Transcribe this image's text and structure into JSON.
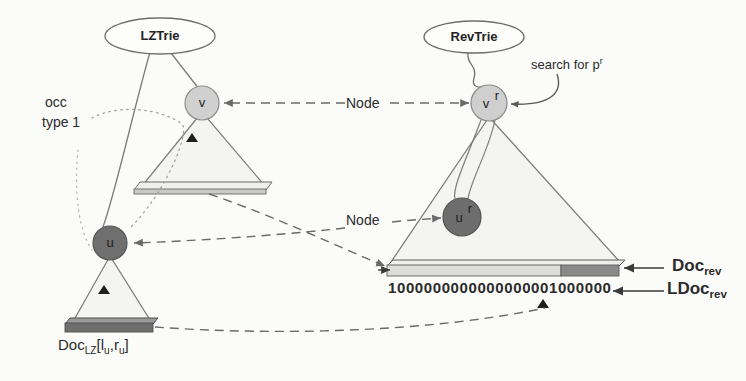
{
  "figure": {
    "background_color": "#fbfbf9"
  },
  "ellipses": [
    {
      "id": "lztrie",
      "label": "LZTrie",
      "cx": 160,
      "cy": 36,
      "rx": 55,
      "ry": 18
    },
    {
      "id": "revtrie",
      "label": "RevTrie",
      "cx": 474,
      "cy": 37,
      "rx": 50,
      "ry": 16
    }
  ],
  "nodes": [
    {
      "id": "v",
      "label": "v",
      "sup": "",
      "cx": 202,
      "cy": 103,
      "r": 17,
      "fill": "#d0d0d0",
      "stroke": "#8d8d8d"
    },
    {
      "id": "u",
      "label": "u",
      "sup": "",
      "cx": 110,
      "cy": 243,
      "r": 17,
      "fill": "#6f6f6f",
      "stroke": "#555555"
    },
    {
      "id": "vr",
      "label": "v",
      "sup": "r",
      "cx": 489,
      "cy": 103,
      "r": 18,
      "fill": "#cfcfcf",
      "stroke": "#8a8a8a"
    },
    {
      "id": "ur",
      "label": "u",
      "sup": "r",
      "cx": 462,
      "cy": 217,
      "r": 19,
      "fill": "#6d6d6d",
      "stroke": "#535353"
    }
  ],
  "triangles": [
    {
      "id": "lztrie-subtree-v",
      "apex_x": 202,
      "apex_y": 112,
      "left_x": 142,
      "right_x": 265,
      "base_y": 190,
      "fill": "#f4f4f2",
      "stroke": "#7d7d7d"
    },
    {
      "id": "lztrie-subtree-u",
      "apex_x": 110,
      "apex_y": 255,
      "left_x": 72,
      "right_x": 152,
      "base_y": 323,
      "fill": "#f4f4f2",
      "stroke": "#7d7d7d"
    },
    {
      "id": "revtrie-subtree-vr",
      "apex_x": 489,
      "apex_y": 115,
      "left_x": 390,
      "right_x": 620,
      "base_y": 263,
      "fill": "#f4f4f2",
      "stroke": "#7d7d7d"
    }
  ],
  "bars": [
    {
      "id": "doc-lz-range-bar-top",
      "x": 142,
      "y": 183,
      "width": 126,
      "height": 11,
      "segments": [
        {
          "fill": "#d8d8d8",
          "width_pct": 100
        }
      ],
      "stroke": "#6a6a6a"
    },
    {
      "id": "doc-lz-bar",
      "x": 69,
      "y": 321,
      "width": 86,
      "height": 12,
      "segments": [
        {
          "fill": "#7a7a7a",
          "width_pct": 100
        }
      ],
      "stroke": "#4f4f4f"
    },
    {
      "id": "doc-rev-bar",
      "x": 390,
      "y": 263,
      "width": 229,
      "height": 13,
      "segments": [
        {
          "fill": "#dcdcda",
          "width_pct": 76
        },
        {
          "fill": "#8a8a8a",
          "width_pct": 24
        }
      ],
      "stroke": "#5c5c5c"
    }
  ],
  "labels": {
    "occ_type": "occ\ntype 1",
    "occ_type_line1": "occ",
    "occ_type_line2": "type 1",
    "node_top": "Node",
    "node_bottom": "Node",
    "search_for": "search for p",
    "search_for_sup": "r",
    "doc_rev": "Doc",
    "doc_rev_sub": "rev",
    "ldoc_rev": "LDoc",
    "ldoc_rev_sub": "rev",
    "doc_lz": "Doc",
    "doc_lz_sub": "LZ",
    "doc_lz_range": "[l",
    "doc_lz_range_sub1": "u",
    "doc_lz_range_mid": ",r",
    "doc_lz_range_sub2": "u",
    "doc_lz_range_end": "]",
    "bitvector": "100000000000000000100000 00"
  },
  "bitvector": {
    "id": "ldoc-rev-bitstring",
    "value": "1000000000000000001000000",
    "x": 388,
    "y": 281,
    "char_width": 8.6,
    "font_size": 14,
    "marker_index": 18
  },
  "connectors": [
    {
      "id": "node-arrow-top",
      "from": "Node-label-top",
      "to": "node-v",
      "style": "dashed",
      "color": "#6a6a6a"
    },
    {
      "id": "node-arrow-top-right",
      "from": "Node-label-top",
      "to": "node-vr",
      "style": "dashed",
      "color": "#6a6a6a"
    },
    {
      "id": "node-arrow-bottom",
      "from": "Node-label-bottom",
      "to": "node-u",
      "style": "dashed",
      "color": "#6a6a6a"
    },
    {
      "id": "node-arrow-bottom-right",
      "from": "Node-label-bottom",
      "to": "node-ur",
      "style": "dashed",
      "color": "#6a6a6a"
    },
    {
      "id": "occ-type-1-dotted",
      "from": "occ-type-1-label",
      "to": "lztrie-subtree",
      "style": "dotted",
      "color": "#9a9a9a"
    },
    {
      "id": "doc-lz-to-doc-rev",
      "from": "doc-lz-bar",
      "to": "ldoc-rev-marker",
      "style": "dashed",
      "color": "#6a6a6a"
    },
    {
      "id": "doc-lz-top-to-doc-rev",
      "from": "doc-lz-range-bar-top",
      "to": "doc-rev-bar",
      "style": "dashed",
      "color": "#6a6a6a"
    },
    {
      "id": "search-arrow",
      "from": "search-for-label",
      "to": "node-vr",
      "style": "solid",
      "color": "#5a5a5a"
    },
    {
      "id": "doc-rev-pointer",
      "from": "doc-rev-label",
      "to": "doc-rev-bar",
      "style": "solid",
      "color": "#3a3a3a"
    },
    {
      "id": "ldoc-rev-pointer",
      "from": "ldoc-rev-label",
      "to": "bitvector",
      "style": "solid",
      "color": "#3a3a3a"
    }
  ]
}
